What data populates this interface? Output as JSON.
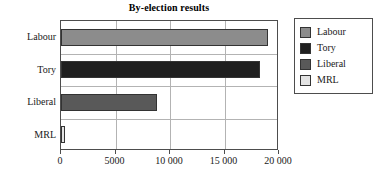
{
  "chart_data": {
    "type": "bar",
    "orientation": "horizontal",
    "title": "By-election results",
    "xlabel": "",
    "ylabel": "",
    "categories": [
      "Labour",
      "Tory",
      "Liberal",
      "MRL"
    ],
    "values": [
      19000,
      18300,
      8800,
      400
    ],
    "series": [
      {
        "name": "By-election results",
        "values": [
          19000,
          18300,
          8800,
          400
        ]
      }
    ],
    "xlim": [
      0,
      20000
    ],
    "ylim": [
      0,
      4
    ],
    "xticks": [
      0,
      5000,
      10000,
      15000,
      20000
    ],
    "xtick_labels": [
      "0",
      "5000",
      "10 000",
      "15 000",
      "20 000"
    ],
    "grid": true,
    "grid_axis": "both",
    "legend_position": "right-outside",
    "legend": [
      {
        "label": "Labour",
        "color": "#8c8c8c"
      },
      {
        "label": "Tory",
        "color": "#1f1f1f"
      },
      {
        "label": "Liberal",
        "color": "#595959"
      },
      {
        "label": "MRL",
        "color": "#e3e3e3"
      }
    ],
    "bar_colors": [
      "#8c8c8c",
      "#1f1f1f",
      "#595959",
      "#e3e3e3"
    ],
    "bar_edge_color": "#333333",
    "axis_color": "#4d4d4d",
    "grid_color": "#b3b3b3",
    "background": "#ffffff"
  }
}
